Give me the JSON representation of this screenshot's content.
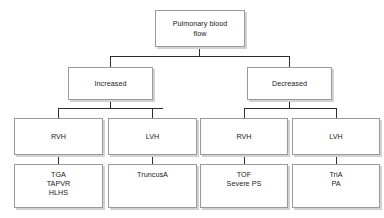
{
  "diagram": {
    "type": "tree-flowchart",
    "colors": {
      "background": "#ffffff",
      "box_fill": "#ffffff",
      "box_border": "#9a9a9a",
      "box_shadow": "#d2d2d2",
      "connector": "#2e2e2e",
      "text": "#1a1a1a"
    },
    "levels": [
      {
        "level": 1,
        "nodes": [
          {
            "id": "root",
            "label": "Pulmonary blood\nflow"
          }
        ]
      },
      {
        "level": 2,
        "nodes": [
          {
            "id": "increased",
            "label": "Increased"
          },
          {
            "id": "decreased",
            "label": "Decreased"
          }
        ]
      },
      {
        "level": 3,
        "nodes": [
          {
            "id": "inc-rvh",
            "label": "RVH"
          },
          {
            "id": "inc-lvh",
            "label": "LVH"
          },
          {
            "id": "dec-rvh",
            "label": "RVH"
          },
          {
            "id": "dec-lvh",
            "label": "LVH"
          }
        ]
      },
      {
        "level": 4,
        "nodes": [
          {
            "id": "inc-rvh-dx",
            "label": "TGA\nTAPVR\nHLHS"
          },
          {
            "id": "inc-lvh-dx",
            "label": "TruncusA"
          },
          {
            "id": "dec-rvh-dx",
            "label": "TOF\nSevere PS"
          },
          {
            "id": "dec-lvh-dx",
            "label": "TriA\nPA"
          }
        ]
      }
    ],
    "nodes": {
      "root": "Pulmonary blood\nflow",
      "increased": "Increased",
      "decreased": "Decreased",
      "inc_rvh": "RVH",
      "inc_lvh": "LVH",
      "dec_rvh": "RVH",
      "dec_lvh": "LVH",
      "inc_rvh_dx": "TGA\nTAPVR\nHLHS",
      "inc_lvh_dx": "TruncusA",
      "dec_rvh_dx": "TOF\nSevere PS",
      "dec_lvh_dx": "TriA\nPA"
    },
    "edges": [
      {
        "from": "root",
        "to": "increased"
      },
      {
        "from": "root",
        "to": "decreased"
      },
      {
        "from": "increased",
        "to": "inc_rvh"
      },
      {
        "from": "increased",
        "to": "inc_lvh"
      },
      {
        "from": "decreased",
        "to": "dec_rvh"
      },
      {
        "from": "decreased",
        "to": "dec_lvh"
      },
      {
        "from": "inc_rvh",
        "to": "inc_rvh_dx"
      },
      {
        "from": "inc_lvh",
        "to": "inc_lvh_dx"
      },
      {
        "from": "dec_rvh",
        "to": "dec_rvh_dx"
      },
      {
        "from": "dec_lvh",
        "to": "dec_lvh_dx"
      }
    ]
  }
}
